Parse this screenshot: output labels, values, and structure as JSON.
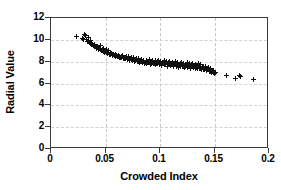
{
  "chart_data": {
    "type": "scatter",
    "title": "",
    "xlabel": "Crowded Index",
    "ylabel": "Radial Value",
    "xlim": [
      0,
      0.2
    ],
    "ylim": [
      0,
      12
    ],
    "xticks": [
      "0",
      "0.05",
      "0.1",
      "0.15",
      "0.2"
    ],
    "xtick_values": [
      0,
      0.05,
      0.1,
      0.15,
      0.2
    ],
    "yticks": [
      "0",
      "2",
      "4",
      "6",
      "8",
      "10",
      "12"
    ],
    "ytick_values": [
      0,
      2,
      4,
      6,
      8,
      10,
      12
    ],
    "grid": true,
    "grid_style": "dashed",
    "legend": "none",
    "marker": "plus",
    "marker_color": "#101010",
    "series": [
      {
        "name": "Radial Value vs Crowded Index",
        "points": [
          [
            0.0235,
            10.35
          ],
          [
            0.0288,
            10.1
          ],
          [
            0.03,
            10.05
          ],
          [
            0.0305,
            10.45
          ],
          [
            0.0318,
            10.4
          ],
          [
            0.033,
            10.0
          ],
          [
            0.0335,
            9.85
          ],
          [
            0.0342,
            10.2
          ],
          [
            0.035,
            9.75
          ],
          [
            0.0358,
            9.65
          ],
          [
            0.0365,
            9.9
          ],
          [
            0.0372,
            9.55
          ],
          [
            0.038,
            9.6
          ],
          [
            0.039,
            9.45
          ],
          [
            0.0398,
            9.5
          ],
          [
            0.0405,
            9.35
          ],
          [
            0.0412,
            9.4
          ],
          [
            0.042,
            9.25
          ],
          [
            0.0428,
            9.3
          ],
          [
            0.0435,
            9.15
          ],
          [
            0.0442,
            9.2
          ],
          [
            0.045,
            9.1
          ],
          [
            0.0455,
            9.45
          ],
          [
            0.0462,
            9.0
          ],
          [
            0.047,
            9.05
          ],
          [
            0.0478,
            8.95
          ],
          [
            0.0485,
            9.25
          ],
          [
            0.049,
            8.85
          ],
          [
            0.0497,
            8.9
          ],
          [
            0.0505,
            9.15
          ],
          [
            0.0512,
            8.8
          ],
          [
            0.052,
            8.75
          ],
          [
            0.0528,
            9.0
          ],
          [
            0.0535,
            8.7
          ],
          [
            0.0542,
            8.85
          ],
          [
            0.055,
            8.65
          ],
          [
            0.0558,
            8.75
          ],
          [
            0.0565,
            8.6
          ],
          [
            0.0572,
            8.7
          ],
          [
            0.058,
            8.55
          ],
          [
            0.0588,
            8.65
          ],
          [
            0.0595,
            8.5
          ],
          [
            0.0602,
            8.6
          ],
          [
            0.061,
            8.45
          ],
          [
            0.0618,
            8.55
          ],
          [
            0.0625,
            8.4
          ],
          [
            0.0632,
            8.5
          ],
          [
            0.064,
            8.35
          ],
          [
            0.0648,
            8.45
          ],
          [
            0.0655,
            8.6
          ],
          [
            0.0662,
            8.3
          ],
          [
            0.067,
            8.4
          ],
          [
            0.0678,
            8.25
          ],
          [
            0.0685,
            8.35
          ],
          [
            0.0692,
            8.5
          ],
          [
            0.07,
            8.2
          ],
          [
            0.0708,
            8.3
          ],
          [
            0.0715,
            8.45
          ],
          [
            0.0722,
            8.15
          ],
          [
            0.073,
            8.25
          ],
          [
            0.0738,
            8.4
          ],
          [
            0.0745,
            8.1
          ],
          [
            0.0752,
            8.2
          ],
          [
            0.076,
            8.35
          ],
          [
            0.0768,
            8.05
          ],
          [
            0.0775,
            8.15
          ],
          [
            0.0782,
            8.3
          ],
          [
            0.079,
            8.0
          ],
          [
            0.0798,
            8.1
          ],
          [
            0.0805,
            8.25
          ],
          [
            0.0812,
            7.95
          ],
          [
            0.082,
            8.05
          ],
          [
            0.0828,
            8.2
          ],
          [
            0.0835,
            7.9
          ],
          [
            0.0842,
            8.0
          ],
          [
            0.085,
            8.15
          ],
          [
            0.0858,
            7.85
          ],
          [
            0.0865,
            7.95
          ],
          [
            0.0872,
            8.1
          ],
          [
            0.088,
            7.8
          ],
          [
            0.0888,
            7.9
          ],
          [
            0.0895,
            8.05
          ],
          [
            0.0902,
            8.2
          ],
          [
            0.091,
            7.75
          ],
          [
            0.0918,
            7.85
          ],
          [
            0.0925,
            8.0
          ],
          [
            0.0932,
            8.15
          ],
          [
            0.094,
            7.8
          ],
          [
            0.0948,
            7.95
          ],
          [
            0.0955,
            8.1
          ],
          [
            0.0962,
            7.7
          ],
          [
            0.097,
            7.85
          ],
          [
            0.0978,
            8.0
          ],
          [
            0.0985,
            8.15
          ],
          [
            0.0992,
            7.75
          ],
          [
            0.1,
            7.9
          ],
          [
            0.1008,
            8.05
          ],
          [
            0.1015,
            7.65
          ],
          [
            0.1022,
            7.8
          ],
          [
            0.103,
            7.95
          ],
          [
            0.1038,
            8.1
          ],
          [
            0.1045,
            7.7
          ],
          [
            0.1052,
            7.85
          ],
          [
            0.106,
            8.0
          ],
          [
            0.1068,
            7.6
          ],
          [
            0.1075,
            7.75
          ],
          [
            0.1082,
            7.9
          ],
          [
            0.109,
            8.05
          ],
          [
            0.1098,
            7.65
          ],
          [
            0.1105,
            7.8
          ],
          [
            0.1112,
            7.95
          ],
          [
            0.112,
            7.55
          ],
          [
            0.1128,
            7.7
          ],
          [
            0.1135,
            7.85
          ],
          [
            0.1142,
            8.0
          ],
          [
            0.115,
            7.6
          ],
          [
            0.1158,
            7.75
          ],
          [
            0.1165,
            7.9
          ],
          [
            0.1172,
            7.5
          ],
          [
            0.118,
            7.65
          ],
          [
            0.1188,
            7.8
          ],
          [
            0.1195,
            7.95
          ],
          [
            0.1202,
            7.55
          ],
          [
            0.121,
            7.7
          ],
          [
            0.1218,
            7.85
          ],
          [
            0.1225,
            7.45
          ],
          [
            0.1232,
            7.6
          ],
          [
            0.124,
            7.75
          ],
          [
            0.1248,
            7.9
          ],
          [
            0.1255,
            7.5
          ],
          [
            0.1262,
            7.65
          ],
          [
            0.127,
            7.8
          ],
          [
            0.1278,
            7.4
          ],
          [
            0.1285,
            7.55
          ],
          [
            0.1292,
            7.7
          ],
          [
            0.13,
            7.85
          ],
          [
            0.1308,
            7.45
          ],
          [
            0.1315,
            7.6
          ],
          [
            0.1322,
            7.75
          ],
          [
            0.133,
            7.35
          ],
          [
            0.1338,
            7.5
          ],
          [
            0.1345,
            7.65
          ],
          [
            0.1352,
            7.8
          ],
          [
            0.136,
            7.4
          ],
          [
            0.1368,
            7.55
          ],
          [
            0.1375,
            7.7
          ],
          [
            0.1382,
            7.3
          ],
          [
            0.139,
            7.45
          ],
          [
            0.1398,
            7.6
          ],
          [
            0.1405,
            7.25
          ],
          [
            0.1412,
            7.4
          ],
          [
            0.142,
            7.55
          ],
          [
            0.1428,
            7.15
          ],
          [
            0.1435,
            7.3
          ],
          [
            0.1442,
            7.45
          ],
          [
            0.145,
            7.1
          ],
          [
            0.1458,
            7.25
          ],
          [
            0.1465,
            7.4
          ],
          [
            0.1472,
            7.05
          ],
          [
            0.148,
            7.2
          ],
          [
            0.1488,
            7.0
          ],
          [
            0.1495,
            7.15
          ],
          [
            0.15,
            6.95
          ],
          [
            0.1505,
            7.05
          ],
          [
            0.0345,
            9.95
          ],
          [
            0.036,
            9.8
          ],
          [
            0.0375,
            9.7
          ],
          [
            0.04,
            9.55
          ],
          [
            0.0425,
            9.35
          ],
          [
            0.0448,
            9.2
          ],
          [
            0.0475,
            9.1
          ],
          [
            0.05,
            8.95
          ],
          [
            0.053,
            8.85
          ],
          [
            0.056,
            8.7
          ],
          [
            0.059,
            8.6
          ],
          [
            0.062,
            8.5
          ],
          [
            0.065,
            8.4
          ],
          [
            0.068,
            8.3
          ],
          [
            0.071,
            8.25
          ],
          [
            0.074,
            8.2
          ],
          [
            0.077,
            8.1
          ],
          [
            0.08,
            8.05
          ],
          [
            0.083,
            8.0
          ],
          [
            0.086,
            7.95
          ],
          [
            0.089,
            7.9
          ],
          [
            0.092,
            7.9
          ],
          [
            0.095,
            7.85
          ],
          [
            0.098,
            7.85
          ],
          [
            0.101,
            7.8
          ],
          [
            0.104,
            7.8
          ],
          [
            0.107,
            7.75
          ],
          [
            0.11,
            7.75
          ],
          [
            0.113,
            7.7
          ],
          [
            0.116,
            7.65
          ],
          [
            0.119,
            7.6
          ],
          [
            0.122,
            7.6
          ],
          [
            0.125,
            7.55
          ],
          [
            0.128,
            7.5
          ],
          [
            0.131,
            7.45
          ],
          [
            0.134,
            7.4
          ],
          [
            0.137,
            7.35
          ],
          [
            0.14,
            7.25
          ],
          [
            0.143,
            7.2
          ],
          [
            0.146,
            7.1
          ],
          [
            0.149,
            7.0
          ],
          [
            0.161,
            6.7
          ],
          [
            0.169,
            6.45
          ],
          [
            0.173,
            6.75
          ],
          [
            0.174,
            6.6
          ],
          [
            0.1855,
            6.4
          ]
        ]
      }
    ]
  }
}
